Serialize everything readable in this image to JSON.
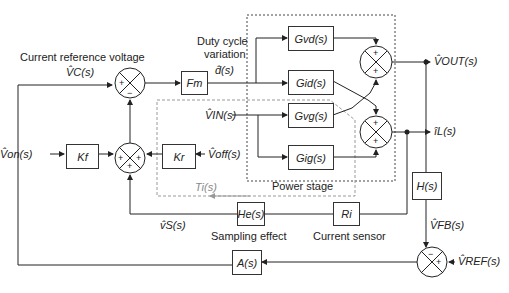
{
  "labels": {
    "current_reference_voltage": "Current reference voltage",
    "duty_cycle_variation_line1": "Duty cycle",
    "duty_cycle_variation_line2": "variation",
    "power_stage": "Power stage",
    "sampling_effect": "Sampling effect",
    "current_sensor": "Current sensor"
  },
  "signals": {
    "vc": "V̂C(s)",
    "d": "d̂(s)",
    "vin": "V̂IN(s)",
    "von": "V̂on(s)",
    "voff": "V̂off(s)",
    "ti": "Ti(s)",
    "vs": "v̂S(s)",
    "vout": "V̂OUT(s)",
    "il": "îL(s)",
    "vfb": "V̂FB(s)",
    "vref": "V̂REF(s)"
  },
  "blocks": {
    "fm": "Fm",
    "gvd": "Gvd(s)",
    "gid": "Gid(s)",
    "gvg": "Gvg(s)",
    "gig": "Gig(s)",
    "kf": "Kf",
    "kr": "Kr",
    "he": "He(s)",
    "ri": "Ri",
    "h": "H(s)",
    "a": "A(s)"
  },
  "summing_junctions": {
    "sum_main_signs": [
      "+",
      "−"
    ],
    "sum_ramp_signs": [
      "+",
      "+",
      "+"
    ],
    "sum_vout_signs": [
      "+",
      "+"
    ],
    "sum_il_signs": [
      "+",
      "+"
    ],
    "sum_fb_signs": [
      "−",
      "+"
    ]
  }
}
